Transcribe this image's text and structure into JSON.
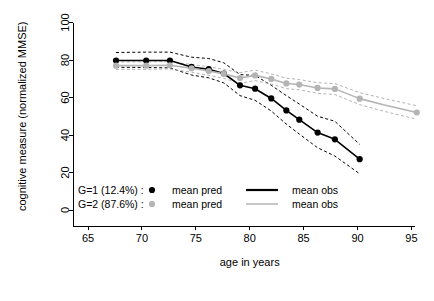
{
  "chart_data": {
    "type": "line",
    "title": "",
    "xlabel": "age in years",
    "ylabel": "cognitive measure (normalized MMSE)",
    "xlim": [
      64.0,
      97.5
    ],
    "ylim": [
      -2,
      104
    ],
    "xticks": [
      65,
      70,
      75,
      80,
      85,
      90,
      95
    ],
    "xtick_labels": [
      "65",
      "70",
      "75",
      "80",
      "85",
      "90",
      "95"
    ],
    "yticks": [
      0,
      20,
      40,
      60,
      80,
      100
    ],
    "ytick_labels": [
      "0",
      "20",
      "40",
      "60",
      "80",
      "100"
    ],
    "grid": false,
    "legend_position": "lower-left-inside",
    "colors": {
      "g1": "#000000",
      "g2": "#b4b4b4",
      "axis": "#000000",
      "background": "#ffffff"
    },
    "series": [
      {
        "name": "G=1 mean obs",
        "group": "g1",
        "role": "mean-obs",
        "style": "solid",
        "color": "#000000",
        "x": [
          67.6,
          70.4,
          72.6,
          74.6,
          76.2,
          77.6,
          79.1,
          80.5,
          82.0,
          83.4,
          84.6,
          86.3,
          87.9,
          90.2
        ],
        "y": [
          79.7,
          79.7,
          79.7,
          76.3,
          75.1,
          72.8,
          66.5,
          64.7,
          59.5,
          53.1,
          48.2,
          41.3,
          37.7,
          27.1
        ]
      },
      {
        "name": "G=1 mean pred",
        "group": "g1",
        "role": "mean-pred",
        "style": "points",
        "color": "#000000",
        "x": [
          67.6,
          70.4,
          72.6,
          74.6,
          76.2,
          77.6,
          79.1,
          80.5,
          82.0,
          83.4,
          84.6,
          86.3,
          87.9,
          90.2
        ],
        "y": [
          79.7,
          79.7,
          79.7,
          76.3,
          75.1,
          72.8,
          66.5,
          64.7,
          59.5,
          53.1,
          48.2,
          41.3,
          37.7,
          27.1
        ]
      },
      {
        "name": "G=1 upper CI",
        "group": "g1",
        "role": "ci-upper",
        "style": "dashed",
        "color": "#000000",
        "x": [
          67.6,
          70.4,
          72.6,
          74.6,
          76.2,
          77.6,
          79.1,
          80.5,
          82.0,
          83.4,
          84.6,
          86.3,
          87.9,
          90.2
        ],
        "y": [
          84.0,
          84.2,
          84.2,
          81.5,
          80.8,
          78.5,
          72.2,
          71.8,
          66.5,
          61.0,
          56.5,
          50.0,
          47.3,
          35.0
        ]
      },
      {
        "name": "G=1 lower CI",
        "group": "g1",
        "role": "ci-lower",
        "style": "dashed",
        "color": "#000000",
        "x": [
          67.6,
          70.4,
          72.6,
          74.6,
          76.2,
          77.6,
          79.1,
          80.5,
          82.0,
          83.4,
          84.6,
          86.3,
          87.9,
          90.2
        ],
        "y": [
          76.1,
          76.0,
          75.8,
          72.0,
          70.5,
          67.8,
          61.0,
          58.5,
          52.8,
          45.8,
          40.5,
          33.2,
          28.8,
          19.3
        ]
      },
      {
        "name": "G=2 mean obs",
        "group": "g2",
        "role": "mean-obs",
        "style": "solid",
        "color": "#b4b4b4",
        "x": [
          67.6,
          70.4,
          72.6,
          74.6,
          76.2,
          77.6,
          79.1,
          80.5,
          82.0,
          83.4,
          84.6,
          86.3,
          87.9,
          90.2,
          92.5,
          95.5
        ],
        "y": [
          77.0,
          77.0,
          77.2,
          75.6,
          74.1,
          72.6,
          70.4,
          71.8,
          69.9,
          67.5,
          66.9,
          65.1,
          64.6,
          59.4,
          56.0,
          52.0
        ]
      },
      {
        "name": "G=2 mean pred",
        "group": "g2",
        "role": "mean-pred",
        "style": "points",
        "color": "#b4b4b4",
        "x": [
          67.6,
          70.4,
          72.6,
          74.6,
          76.2,
          77.6,
          79.1,
          80.5,
          82.0,
          83.4,
          84.6,
          86.3,
          87.9,
          90.2,
          95.5
        ],
        "y": [
          77.0,
          77.0,
          77.2,
          75.6,
          74.1,
          72.6,
          70.4,
          71.8,
          69.9,
          67.5,
          66.9,
          65.1,
          64.6,
          59.4,
          52.0
        ]
      },
      {
        "name": "G=2 upper CI",
        "group": "g2",
        "role": "ci-upper",
        "style": "dashed",
        "color": "#b4b4b4",
        "x": [
          67.6,
          70.4,
          72.6,
          74.6,
          76.2,
          77.6,
          79.1,
          80.5,
          82.0,
          83.4,
          84.6,
          86.3,
          87.9,
          90.2,
          92.5,
          95.5
        ],
        "y": [
          79.0,
          79.0,
          79.2,
          77.6,
          76.4,
          75.0,
          73.2,
          74.6,
          72.6,
          70.3,
          69.6,
          67.9,
          67.4,
          62.6,
          59.4,
          55.6
        ]
      },
      {
        "name": "G=2 lower CI",
        "group": "g2",
        "role": "ci-lower",
        "style": "dashed",
        "color": "#b4b4b4",
        "x": [
          67.6,
          70.4,
          72.6,
          74.6,
          76.2,
          77.6,
          79.1,
          80.5,
          82.0,
          83.4,
          84.6,
          86.3,
          87.9,
          90.2,
          92.5,
          95.5
        ],
        "y": [
          75.0,
          75.0,
          75.2,
          73.5,
          71.8,
          70.2,
          67.6,
          69.0,
          67.2,
          64.7,
          64.1,
          62.2,
          61.6,
          56.2,
          52.6,
          48.4
        ]
      }
    ],
    "legend": {
      "rows": [
        {
          "group_label": "G=1 (12.4%) :",
          "pred_label": "mean pred",
          "obs_label": "mean obs",
          "color": "#000000"
        },
        {
          "group_label": "G=2 (87.6%) :",
          "pred_label": "mean pred",
          "obs_label": "mean obs",
          "color": "#b4b4b4"
        }
      ]
    }
  }
}
